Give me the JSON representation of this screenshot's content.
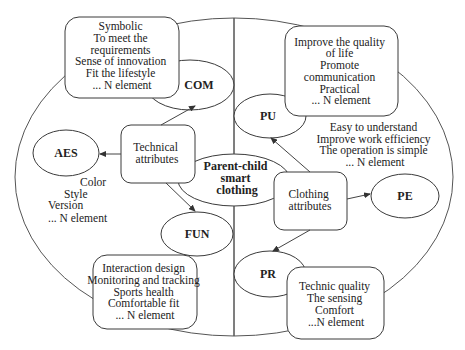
{
  "diagram": {
    "center": {
      "lines": [
        "Parent-child",
        "smart",
        "clothing"
      ]
    },
    "left_half": {
      "hub": {
        "lines": [
          "Technical",
          "attributes"
        ]
      },
      "nodes": {
        "com": {
          "label": "COM"
        },
        "aes": {
          "label": "AES"
        },
        "fun": {
          "label": "FUN"
        }
      },
      "com_box": {
        "lines": [
          "Symbolic",
          "To meet the",
          "requirements",
          "Sense of innovation",
          "Fit the lifestyle",
          "... N element"
        ]
      },
      "aes_text": {
        "lines": [
          "Color",
          "Style",
          "Version",
          "... N element"
        ]
      },
      "fun_box": {
        "lines": [
          "Interaction design",
          "Monitoring and tracking",
          "Sports health",
          "Comfortable fit",
          "... N element"
        ]
      }
    },
    "right_half": {
      "hub": {
        "lines": [
          "Clothing",
          "attributes"
        ]
      },
      "nodes": {
        "pu": {
          "label": "PU"
        },
        "pe": {
          "label": "PE"
        },
        "pr": {
          "label": "PR"
        }
      },
      "pu_box": {
        "lines": [
          "Improve the quality",
          "of life",
          "Promote",
          "communication",
          "Practical",
          "... N element"
        ]
      },
      "pe_text": {
        "lines": [
          "Easy to understand",
          "Improve work efficiency",
          "The operation is simple",
          "... N element"
        ]
      },
      "pr_box": {
        "lines": [
          "Technic quality",
          "The sensing",
          "Comfort",
          "...N element"
        ]
      }
    },
    "edges": [
      {
        "from": "Technical attributes",
        "to": "COM"
      },
      {
        "from": "Technical attributes",
        "to": "AES"
      },
      {
        "from": "Technical attributes",
        "to": "FUN"
      },
      {
        "from": "Clothing attributes",
        "to": "PU"
      },
      {
        "from": "Clothing attributes",
        "to": "PE"
      },
      {
        "from": "Clothing attributes",
        "to": "PR"
      }
    ],
    "colors": {
      "stroke": "#3a3a3a",
      "text": "#222222",
      "background": "#ffffff"
    }
  }
}
